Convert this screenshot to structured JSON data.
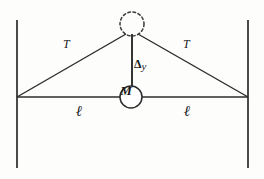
{
  "figure": {
    "background_color": "#fdfdfc",
    "stroke_color": "#2b2b2b"
  },
  "labels": {
    "tension_left": "T",
    "tension_right": "T",
    "length_left": "ℓ",
    "length_right": "ℓ",
    "sag_delta": "Δ",
    "sag_variable": "y",
    "mass": "M"
  },
  "geometry": {
    "left_wall": {
      "x": 17,
      "y_top": 20,
      "y_bottom": 168
    },
    "right_wall": {
      "x": 248,
      "y_top": 20,
      "y_bottom": 168
    },
    "left_anchor": {
      "x": 17,
      "y": 97
    },
    "right_anchor": {
      "x": 248,
      "y": 97
    },
    "apex": {
      "x": 132,
      "y": 34
    },
    "mass_center": {
      "x": 131,
      "y": 97,
      "radius": 11
    },
    "ghost_circle": {
      "cx": 132,
      "cy": 24,
      "r": 12,
      "style": "dashed"
    },
    "horizontal_line_y": 97
  },
  "label_positions": {
    "tension_left": {
      "x": 63,
      "y": 38
    },
    "tension_right": {
      "x": 183,
      "y": 38
    },
    "length_left": {
      "x": 76,
      "y": 105
    },
    "length_right": {
      "x": 184,
      "y": 105
    },
    "sag": {
      "x": 134,
      "y": 58
    },
    "mass": {
      "x": 125,
      "y": 90
    }
  }
}
